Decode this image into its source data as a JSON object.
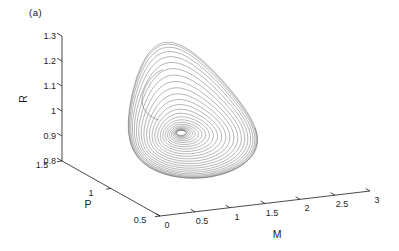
{
  "figure_label": "(a)",
  "chart_data": {
    "type": "line",
    "subtype": "3d_phase_trajectory",
    "title": "",
    "axes": {
      "M": {
        "label": "M",
        "range": [
          0,
          3
        ],
        "ticks": [
          0,
          0.5,
          1,
          1.5,
          2,
          2.5,
          3
        ]
      },
      "P": {
        "label": "P",
        "range": [
          0.5,
          1.5
        ],
        "ticks": [
          0.5,
          1,
          1.5
        ]
      },
      "R": {
        "label": "R",
        "range": [
          0.8,
          1.3
        ],
        "ticks": [
          0.8,
          0.9,
          1,
          1.1,
          1.2,
          1.3
        ]
      }
    },
    "grid": false,
    "legend": null,
    "colors": {
      "trajectory": "#404040",
      "axis": "#1a1a1a",
      "background": "#ffffff"
    },
    "trajectory": {
      "loops": 26,
      "points_per_loop": 150,
      "s_min": 0.07,
      "s_span": 0.93,
      "center": {
        "M": 0.916,
        "P": 0.95,
        "R": 1.0065
      },
      "drift": {
        "M": 0.242,
        "P": 0.02,
        "R": -0.0605
      },
      "cos_vec": {
        "M": 0.6477,
        "P": -0.17,
        "R": 0.0518
      },
      "sin_vec": {
        "M": -0.2,
        "P": 0.0,
        "R": 0.1427
      },
      "bump_vec": {
        "M": 0.261,
        "P": 0.35,
        "R": 0.1863
      },
      "bump_exponent": 2.5,
      "bump_width": 2.2,
      "bump_phase": 1.5708
    },
    "transient": {
      "s": 0.56,
      "theta_start": 1.7,
      "theta_end": 3.9,
      "points": 60,
      "offset": {
        "M": -0.143,
        "P": 0.0,
        "R": 0.1448
      }
    }
  }
}
